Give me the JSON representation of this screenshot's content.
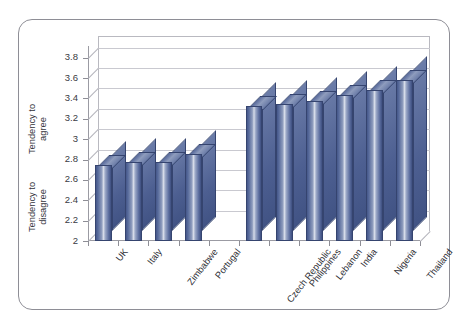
{
  "chart_data": {
    "type": "bar",
    "title": "",
    "xlabel": "",
    "ylabel": "",
    "ylim": [
      2,
      3.9
    ],
    "grid": true,
    "legend": "none",
    "three_d": true,
    "axis_group_labels": [
      {
        "text_line1": "Tendency to",
        "text_line2": "agree",
        "position": "upper"
      },
      {
        "text_line1": "Tendency to",
        "text_line2": "disagree",
        "position": "lower"
      }
    ],
    "ytick_labels": [
      "2",
      "2.2",
      "2.4",
      "2.6",
      "2.8",
      "3",
      "3.2",
      "3.4",
      "3.6",
      "3.8"
    ],
    "ytick_values": [
      2,
      2.2,
      2.4,
      2.6,
      2.8,
      3,
      3.2,
      3.4,
      3.6,
      3.8
    ],
    "categories": [
      "UK",
      "Italy",
      "Zimbabwe",
      "Portugal",
      "",
      "Czech Republic",
      "Philippines",
      "Lebanon",
      "India",
      "Nigeria",
      "Thailand"
    ],
    "values": [
      2.75,
      2.78,
      2.78,
      2.85,
      null,
      3.33,
      3.35,
      3.37,
      3.43,
      3.48,
      3.58
    ],
    "series": [
      {
        "name": "Tendency",
        "values": [
          2.75,
          2.78,
          2.78,
          2.85,
          null,
          3.33,
          3.35,
          3.37,
          3.43,
          3.48,
          3.58
        ]
      }
    ],
    "bar_color_dark": "#3e4f80",
    "bar_color_mid": "#5d6fa0",
    "bar_color_light": "#d6dce9",
    "gridline_color": "#c9c9d0",
    "axis_color": "#8e8e96",
    "frame_color": "#8e8e96",
    "background": "#ffffff"
  }
}
